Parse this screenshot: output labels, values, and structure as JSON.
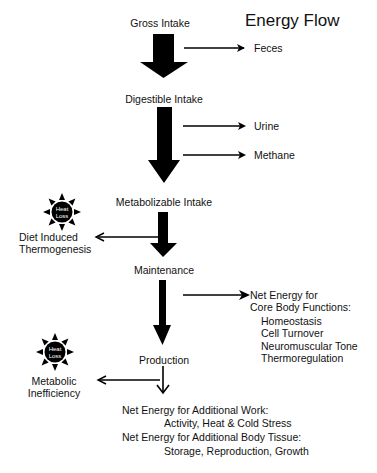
{
  "title": "Energy Flow",
  "stages": {
    "gross_intake": "Gross Intake",
    "digestible_intake": "Digestible Intake",
    "metabolizable_intake": "Metabolizable Intake",
    "maintenance": "Maintenance",
    "production": "Production"
  },
  "losses": {
    "feces": "Feces",
    "urine": "Urine",
    "methane": "Methane",
    "diet_induced_line1": "Diet Induced",
    "diet_induced_line2": "Thermogenesis",
    "metabolic_line1": "Metabolic",
    "metabolic_line2": "Inefficiency"
  },
  "heat_loss_icon": {
    "line1": "Heat",
    "line2": "Loss"
  },
  "core_functions": {
    "heading_line1": "Net Energy for",
    "heading_line2": "Core Body Functions:",
    "items": [
      "Homeostasis",
      "Cell Turnover",
      "Neuromuscular Tone",
      "Thermoregulation"
    ]
  },
  "production_outputs": {
    "work_heading": "Net Energy for Additional Work:",
    "work_detail": "Activity, Heat & Cold Stress",
    "tissue_heading": "Net Energy for Additional Body Tissue:",
    "tissue_detail": "Storage, Reproduction, Growth"
  }
}
